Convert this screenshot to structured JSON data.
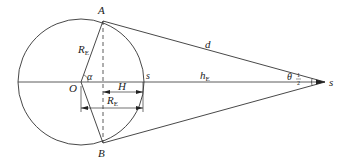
{
  "diagram": {
    "labels": {
      "A": "A",
      "B": "B",
      "O": "O",
      "s_on_circle": "s",
      "s_apex": "s",
      "alpha": "α",
      "R_E_radius": "R",
      "R_E_radius_sub": "E",
      "R_E_dim": "R",
      "R_E_dim_sub": "E",
      "H": "H",
      "d": "d",
      "h_E": "h",
      "h_E_sub": "E",
      "theta": "θ",
      "theta_num": "1",
      "theta_den": "2"
    },
    "colors": {
      "stroke": "#333333",
      "text": "#222222",
      "background": "#ffffff"
    }
  }
}
